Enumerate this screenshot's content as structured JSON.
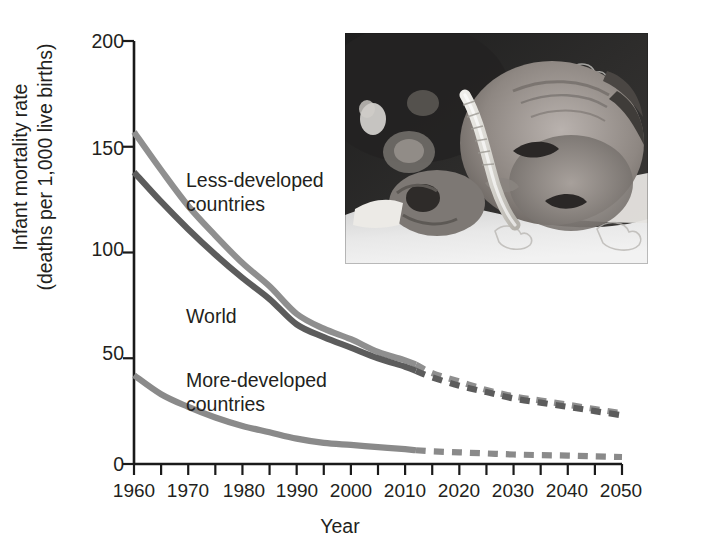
{
  "figure": {
    "credit": "(Compiled by the authors using data from United Nations Population\nDivision.)",
    "photo_caption": "premature-infant-photo"
  },
  "chart_data": {
    "type": "line",
    "title": "",
    "xlabel": "Year",
    "ylabel": "Infant mortality rate\n(deaths per 1,000 live births)",
    "xlim": [
      1960,
      2050
    ],
    "ylim": [
      0,
      200
    ],
    "xticks": [
      1960,
      1970,
      1980,
      1990,
      2000,
      2010,
      2020,
      2030,
      2040,
      2050
    ],
    "xtick_labels": [
      "1960",
      "1970",
      "1980",
      "1990",
      "2000",
      "2010",
      "2020",
      "2030",
      "2040",
      "2050"
    ],
    "minor_xtick_step": 5,
    "yticks": [
      0,
      50,
      100,
      150,
      200
    ],
    "ytick_labels": [
      "0",
      "50",
      "100",
      "150",
      "200"
    ],
    "grid": false,
    "legend": "inline-labels",
    "projection_starts": 2012,
    "x": [
      1960,
      1965,
      1970,
      1975,
      1980,
      1985,
      1990,
      1995,
      2000,
      2005,
      2010,
      2012,
      2015,
      2020,
      2025,
      2030,
      2035,
      2040,
      2045,
      2050
    ],
    "series": [
      {
        "name": "Less-developed countries",
        "label": "Less-developed\ncountries",
        "color": "#8f8f8f",
        "values": [
          157,
          139,
          122,
          108,
          95,
          84,
          71,
          64,
          59,
          53,
          49,
          47,
          43,
          39,
          35,
          32,
          30,
          28,
          26,
          24
        ],
        "solid_until": 2012
      },
      {
        "name": "World",
        "label": "World",
        "color": "#5c5c5c",
        "values": [
          138,
          124,
          111,
          99,
          88,
          78,
          66,
          60,
          55,
          50,
          46,
          44,
          41,
          37,
          34,
          31,
          29,
          27,
          25,
          23
        ],
        "solid_until": 2012
      },
      {
        "name": "More-developed countries",
        "label": "More-developed\ncountries",
        "color": "#8a8a8a",
        "values": [
          42,
          33,
          27,
          22,
          18,
          15,
          12,
          10,
          9,
          8,
          7,
          6.5,
          6,
          5.5,
          5,
          4.5,
          4.2,
          4,
          3.6,
          3.3
        ],
        "solid_until": 2012
      }
    ],
    "series_label_positions": [
      {
        "name": "Less-developed countries",
        "left": 186,
        "top": 168
      },
      {
        "name": "World",
        "left": 186,
        "top": 304
      },
      {
        "name": "More-developed countries",
        "left": 186,
        "top": 368
      }
    ]
  }
}
